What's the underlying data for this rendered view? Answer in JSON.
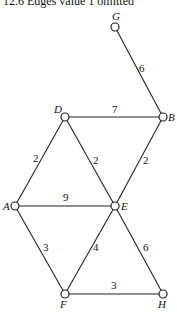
{
  "title": "12.6 Edges value 1 omitted",
  "nodes": [
    {
      "id": "G",
      "x": 115,
      "y": 27,
      "lx": 112,
      "ly": 20
    },
    {
      "id": "B",
      "x": 163,
      "y": 117,
      "lx": 168,
      "ly": 121
    },
    {
      "id": "D",
      "x": 65,
      "y": 117,
      "lx": 54,
      "ly": 113
    },
    {
      "id": "A",
      "x": 15,
      "y": 206,
      "lx": 3,
      "ly": 210
    },
    {
      "id": "E",
      "x": 115,
      "y": 206,
      "lx": 121,
      "ly": 210
    },
    {
      "id": "F",
      "x": 65,
      "y": 294,
      "lx": 60,
      "ly": 308
    },
    {
      "id": "H",
      "x": 163,
      "y": 294,
      "lx": 158,
      "ly": 308
    }
  ],
  "edges": [
    {
      "from": "G",
      "to": "B",
      "weight": "6",
      "wx": 139,
      "wy": 72
    },
    {
      "from": "D",
      "to": "B",
      "weight": "7",
      "wx": 112,
      "wy": 113
    },
    {
      "from": "D",
      "to": "A",
      "weight": "2",
      "wx": 33,
      "wy": 162
    },
    {
      "from": "D",
      "to": "E",
      "weight": "2",
      "wx": 93,
      "wy": 164
    },
    {
      "from": "B",
      "to": "E",
      "weight": "2",
      "wx": 143,
      "wy": 164
    },
    {
      "from": "A",
      "to": "E",
      "weight": "9",
      "wx": 63,
      "wy": 201
    },
    {
      "from": "A",
      "to": "F",
      "weight": "3",
      "wx": 43,
      "wy": 251
    },
    {
      "from": "E",
      "to": "F",
      "weight": "4",
      "wx": 93,
      "wy": 251
    },
    {
      "from": "E",
      "to": "H",
      "weight": "6",
      "wx": 143,
      "wy": 251
    },
    {
      "from": "F",
      "to": "H",
      "weight": "3",
      "wx": 111,
      "wy": 289
    }
  ]
}
